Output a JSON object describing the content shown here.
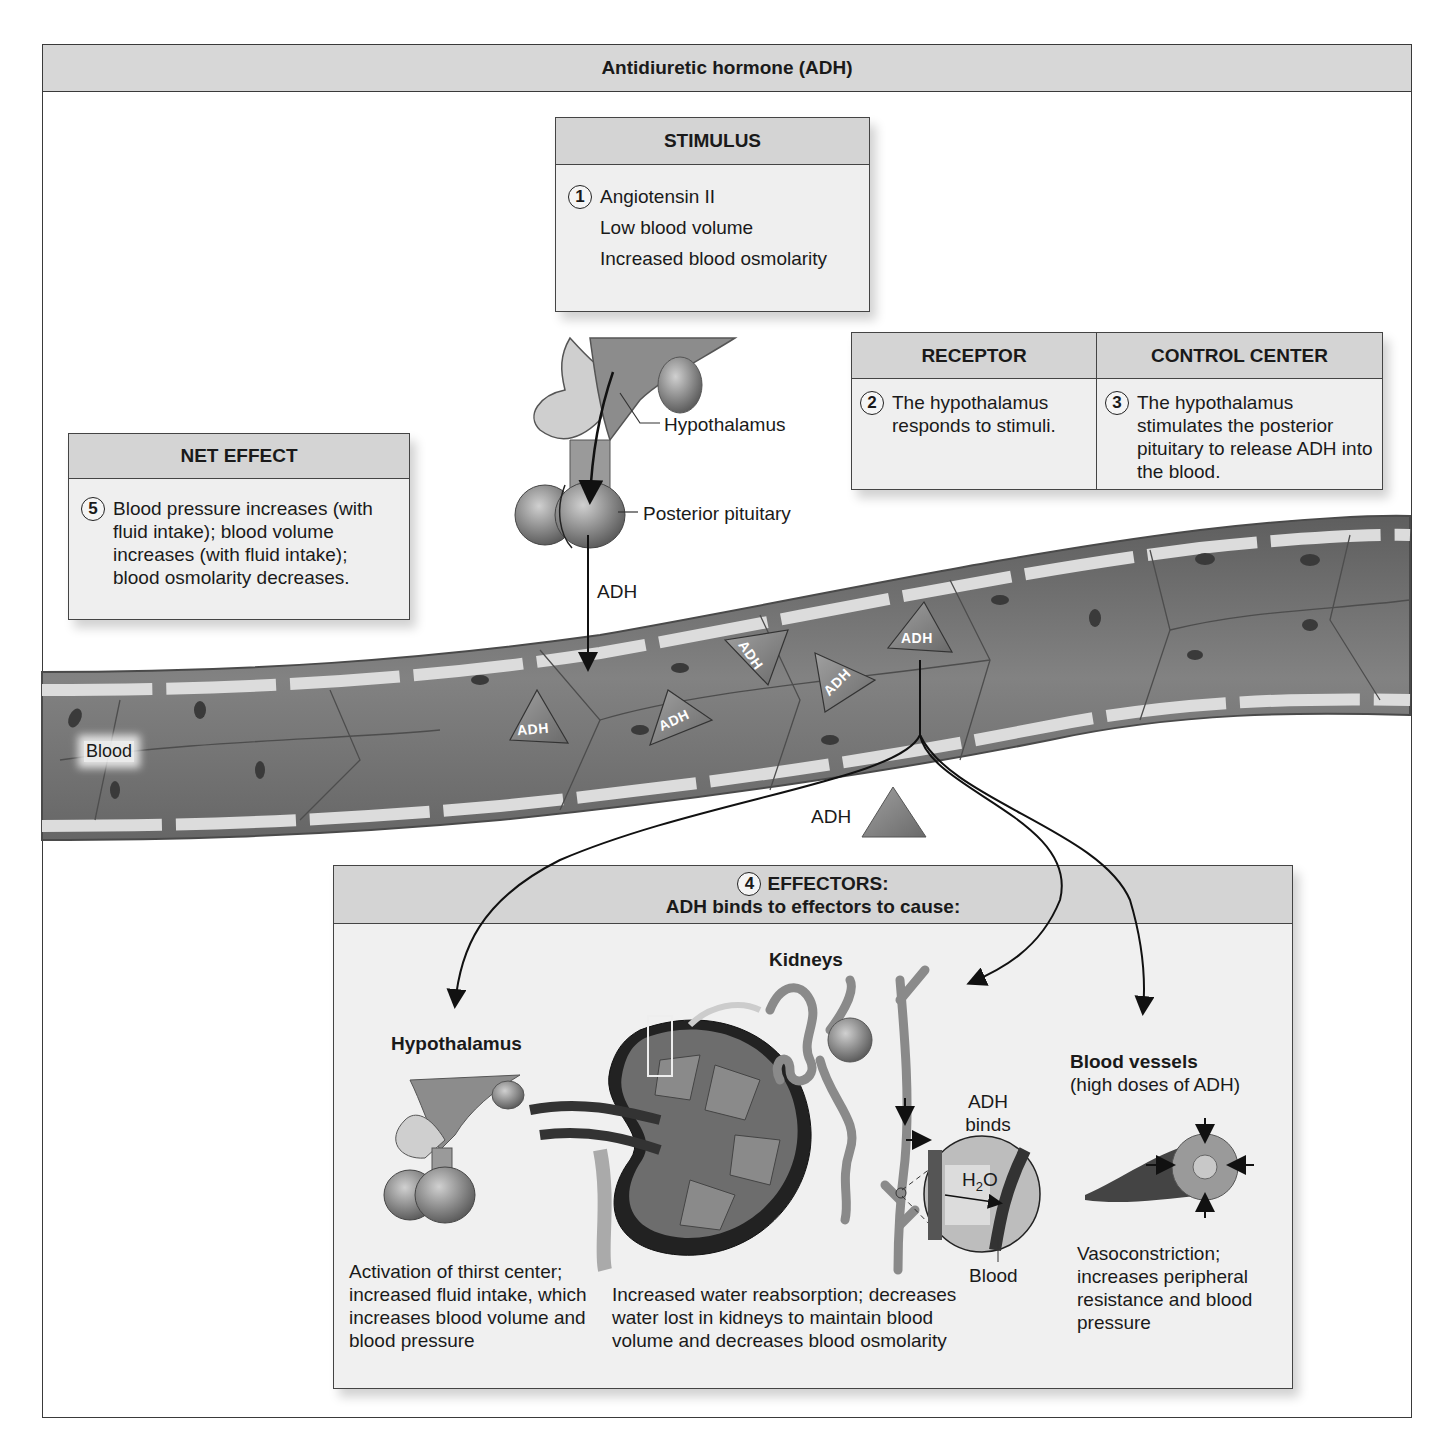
{
  "title": "Antidiuretic hormone (ADH)",
  "stimulus": {
    "heading": "STIMULUS",
    "step": "1",
    "items": [
      "Angiotensin II",
      "Low blood volume",
      "Increased blood osmolarity"
    ]
  },
  "receptor": {
    "heading": "RECEPTOR",
    "step": "2",
    "text": "The hypothalamus responds to stimuli."
  },
  "control_center": {
    "heading": "CONTROL CENTER",
    "step": "3",
    "text": "The hypothalamus stimulates the posterior pituitary to release ADH into the blood."
  },
  "net_effect": {
    "heading": "NET EFFECT",
    "step": "5",
    "text": "Blood pressure increases (with fluid intake); blood volume increases (with fluid intake); blood osmolarity decreases."
  },
  "brain_labels": {
    "hypothalamus": "Hypothalamus",
    "posterior_pituitary": "Posterior pituitary",
    "adh_arrow": "ADH"
  },
  "vessel": {
    "blood_label": "Blood",
    "adh_triangles": [
      "ADH",
      "ADH",
      "ADH",
      "ADH",
      "ADH"
    ],
    "free_adh_label": "ADH"
  },
  "effectors": {
    "step": "4",
    "heading_line1": "EFFECTORS:",
    "heading_line2": "ADH binds to effectors to cause:",
    "hypothalamus": {
      "title": "Hypothalamus",
      "text": "Activation of thirst center; increased fluid intake, which increases blood volume and blood pressure"
    },
    "kidneys": {
      "title": "Kidneys",
      "adh_binds": "ADH binds",
      "water": "H2O",
      "blood": "Blood",
      "text": "Increased water reabsorption; decreases water lost in kidneys to maintain blood volume and decreases blood osmolarity"
    },
    "blood_vessels": {
      "title": "Blood vessels",
      "subtitle": "(high doses of ADH)",
      "text": "Vasoconstriction; increases peripheral resistance and blood pressure"
    }
  },
  "colors": {
    "header_gray": "#d4d4d4",
    "box_fill": "#efefef",
    "vessel_dark": "#6e6e6e",
    "vessel_light": "#d9d9d9",
    "triangle_fill": "#8a8a8a"
  }
}
